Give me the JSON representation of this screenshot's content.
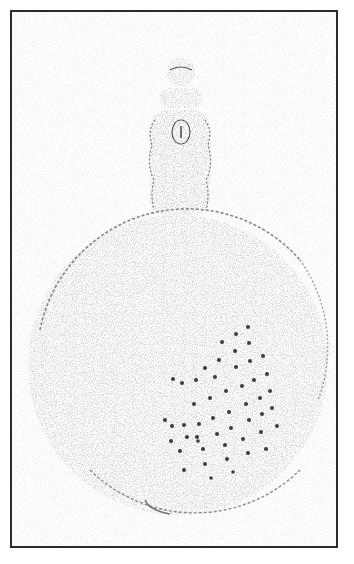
{
  "image": {
    "subject": "glass flask with stopper",
    "description": "Scanned line/stipple illustration of a round-bodied glass flask with a knobbed stopper inside a rectangular frame",
    "colors": {
      "background": "#ffffff",
      "frame": "#2a2a2a",
      "stipple": "#555555",
      "dots": "#3a3a3a"
    }
  }
}
